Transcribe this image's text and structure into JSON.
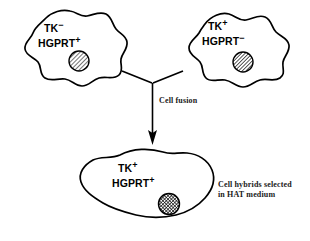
{
  "figure": {
    "background_color": "#ffffff",
    "line_color": "#000000"
  },
  "parent_cells": [
    {
      "id": "parent-cell-left",
      "marker_tk": "TK",
      "marker_tk_sign": "−",
      "marker_hgprt": "HGPRT",
      "marker_hgprt_sign": "+",
      "nucleus": "light-hatched-nucleus"
    },
    {
      "id": "parent-cell-right",
      "marker_tk": "TK",
      "marker_tk_sign": "+",
      "marker_hgprt": "HGPRT",
      "marker_hgprt_sign": "−",
      "nucleus": "diagonal-hatched-nucleus"
    }
  ],
  "fusion": {
    "arrow_label": "Cell fusion",
    "arrow_name": "fusion-arrow"
  },
  "hybrid_cell": {
    "id": "hybrid-cell",
    "marker_tk": "TK",
    "marker_tk_sign": "+",
    "marker_hgprt": "HGPRT",
    "marker_hgprt_sign": "+",
    "nucleus": "dense-crosshatched-nucleus"
  },
  "selection_caption": {
    "line1": "Cell hybrids selected",
    "line2": "in HAT medium"
  }
}
